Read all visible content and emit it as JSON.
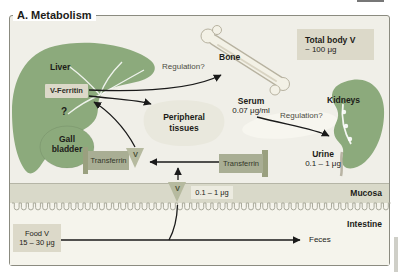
{
  "title": "A. Metabolism",
  "organs": {
    "liver": "Liver",
    "gall_bladder_line1": "Gall",
    "gall_bladder_line2": "bladder",
    "bone": "Bone",
    "kidneys": "Kidneys"
  },
  "liver_store": {
    "label": "V-Ferritin",
    "unknown": "?"
  },
  "pools": {
    "total_body": {
      "title": "Total body V",
      "value": "~ 100 μg"
    },
    "serum": {
      "title": "Serum",
      "value": "0.07 μg/ml"
    },
    "urine": {
      "title": "Urine",
      "value": "0.1 – 1 μg"
    },
    "food": {
      "title": "Food V",
      "value": "15 – 30 μg"
    },
    "absorption": {
      "value": "0.1 – 1 μg"
    },
    "peripheral": {
      "line1": "Peripheral",
      "line2": "tissues"
    }
  },
  "transport": {
    "transferrin_left": "Transferrin",
    "transferrin_right": "Transferrin",
    "v_left": "V",
    "v_mucosa": "V"
  },
  "annotations": {
    "regulation_bone": "Regulation?",
    "regulation_kidney": "Regulation?",
    "feces": "Feces",
    "mucosa": "Mucosa",
    "intestine": "Intestine"
  },
  "colors": {
    "background": "#f0efe8",
    "lower_background": "#f5f4ec",
    "mucosa_band": "#d9d9c9",
    "organ_green": "#8caa7c",
    "box_beige": "#dcd9c9",
    "light_box": "#ecebe0",
    "transferrin": "#a9ae94",
    "transferrin_dark": "#9aa07f",
    "triangle": "#b6ba9f",
    "bone_fill": "#f3f1e6",
    "bone_outline": "#b7b2a0",
    "blob": "#e9e8dd",
    "arrow": "#1a1a1a",
    "frame_border": "#8b8b80",
    "text": "#1c1c18"
  }
}
